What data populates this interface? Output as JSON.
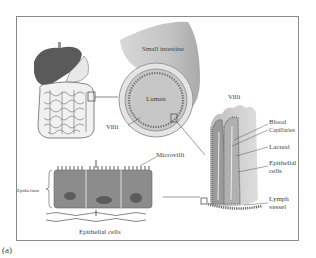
{
  "figure": {
    "caption": "(a)",
    "labels": {
      "small_intestine": "Small intestine",
      "lumen": "Lumen",
      "villi_circle": "Villi",
      "villi_title": "Villi",
      "blood": "Blood",
      "capillaries": "Capillaries",
      "lacteal": "Lacteal",
      "epithelial_cells_1": "Epithelial",
      "epithelial_cells_2": "cells",
      "lymph_1": "Lymph",
      "lymph_2": "vessel",
      "microvilli": "Microvilli",
      "epithelium": "Epithelium",
      "epithelial_cells_bottom": "Epithelial cells"
    }
  }
}
